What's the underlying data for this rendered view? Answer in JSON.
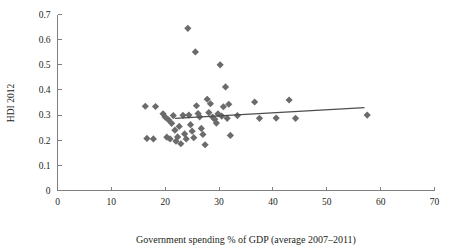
{
  "chart_data": {
    "type": "scatter",
    "title": "",
    "xlabel": "Government spending % of GDP (average 2007–2011)",
    "ylabel": "HDI 2012",
    "xlim": [
      0,
      70
    ],
    "ylim": [
      0,
      0.7
    ],
    "xticks": [
      0,
      10,
      20,
      30,
      40,
      50,
      60,
      70
    ],
    "xtick_labels": [
      "0",
      "10",
      "20",
      "30",
      "40",
      "50",
      "60",
      "70"
    ],
    "yticks": [
      0,
      0.1,
      0.2,
      0.3,
      0.4,
      0.5,
      0.6,
      0.7
    ],
    "ytick_labels": [
      "0",
      "0.1",
      "0.2",
      "0.3",
      "0.4",
      "0.5",
      "0.6",
      "0.7"
    ],
    "grid": false,
    "legend": false,
    "marker_shape": "diamond",
    "marker_color": "#6b6b6b",
    "points": [
      {
        "x": 16.3,
        "y": 0.335
      },
      {
        "x": 16.6,
        "y": 0.207
      },
      {
        "x": 17.8,
        "y": 0.205
      },
      {
        "x": 18.2,
        "y": 0.334
      },
      {
        "x": 19.6,
        "y": 0.305
      },
      {
        "x": 20.0,
        "y": 0.292
      },
      {
        "x": 20.3,
        "y": 0.212
      },
      {
        "x": 20.6,
        "y": 0.281
      },
      {
        "x": 20.9,
        "y": 0.205
      },
      {
        "x": 21.2,
        "y": 0.267
      },
      {
        "x": 21.5,
        "y": 0.298
      },
      {
        "x": 21.8,
        "y": 0.24
      },
      {
        "x": 22.0,
        "y": 0.196
      },
      {
        "x": 22.3,
        "y": 0.213
      },
      {
        "x": 22.6,
        "y": 0.255
      },
      {
        "x": 22.9,
        "y": 0.186
      },
      {
        "x": 23.3,
        "y": 0.299
      },
      {
        "x": 23.6,
        "y": 0.225
      },
      {
        "x": 23.9,
        "y": 0.205
      },
      {
        "x": 24.2,
        "y": 0.645
      },
      {
        "x": 24.4,
        "y": 0.3
      },
      {
        "x": 24.7,
        "y": 0.262
      },
      {
        "x": 25.0,
        "y": 0.236
      },
      {
        "x": 25.3,
        "y": 0.21
      },
      {
        "x": 25.6,
        "y": 0.551
      },
      {
        "x": 25.8,
        "y": 0.337
      },
      {
        "x": 26.1,
        "y": 0.306
      },
      {
        "x": 26.4,
        "y": 0.293
      },
      {
        "x": 26.7,
        "y": 0.247
      },
      {
        "x": 27.0,
        "y": 0.223
      },
      {
        "x": 27.4,
        "y": 0.182
      },
      {
        "x": 27.8,
        "y": 0.363
      },
      {
        "x": 28.1,
        "y": 0.31
      },
      {
        "x": 28.4,
        "y": 0.345
      },
      {
        "x": 28.8,
        "y": 0.292
      },
      {
        "x": 29.2,
        "y": 0.283
      },
      {
        "x": 29.5,
        "y": 0.268
      },
      {
        "x": 29.8,
        "y": 0.305
      },
      {
        "x": 30.2,
        "y": 0.5
      },
      {
        "x": 30.5,
        "y": 0.296
      },
      {
        "x": 30.8,
        "y": 0.333
      },
      {
        "x": 31.2,
        "y": 0.412
      },
      {
        "x": 31.5,
        "y": 0.287
      },
      {
        "x": 31.8,
        "y": 0.343
      },
      {
        "x": 32.1,
        "y": 0.219
      },
      {
        "x": 33.4,
        "y": 0.298
      },
      {
        "x": 36.6,
        "y": 0.352
      },
      {
        "x": 37.5,
        "y": 0.287
      },
      {
        "x": 40.6,
        "y": 0.288
      },
      {
        "x": 43.0,
        "y": 0.36
      },
      {
        "x": 44.2,
        "y": 0.287
      },
      {
        "x": 57.5,
        "y": 0.3
      }
    ],
    "trend_line": {
      "x_start": 21.8,
      "y_start": 0.287,
      "x_end": 57.0,
      "y_end": 0.33
    }
  }
}
